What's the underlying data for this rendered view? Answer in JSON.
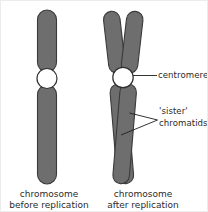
{
  "figure": {
    "background_color": "#ffffff",
    "chromatid_fill": "#6e6e6e",
    "chromatid_stroke": "#3a3a3a",
    "centromere_fill": "#ffffff",
    "centromere_stroke": "#2f2f2f",
    "leader_line_color": "#1e1e1e",
    "text_color": "#2b2b2b"
  },
  "labels": {
    "centromere": "centromere",
    "sister_line1": "'sister'",
    "sister_line2": "chromatids"
  },
  "captions": {
    "left_line1": "chromosome",
    "left_line2": "before replication",
    "right_line1": "chromosome",
    "right_line2": "after replication"
  },
  "parts": {
    "left_chromosome_name": "chromosome before replication",
    "right_chromosome_name": "chromosome after replication",
    "left_upper_arm": "upper arm",
    "left_lower_arm": "lower arm",
    "right_chromatid_a": "sister chromatid A",
    "right_chromatid_b": "sister chromatid B",
    "centromere_left": "centromere",
    "centromere_right": "centromere"
  }
}
